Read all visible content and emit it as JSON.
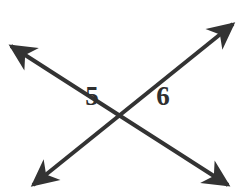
{
  "figure": {
    "type": "geometry-diagram",
    "background_color": "#ffffff",
    "stroke_color": "#333333",
    "label_color": "#2f2f2f",
    "canvas": {
      "width": 245,
      "height": 191
    },
    "intersection": {
      "x": 130,
      "y": 87
    },
    "lines": [
      {
        "name": "line-upper-left-to-lower-right",
        "from": {
          "x": 11,
          "y": 46
        },
        "to": {
          "x": 228,
          "y": 185
        },
        "stroke_width": 4,
        "arrow_start": true,
        "arrow_end": true
      },
      {
        "name": "line-lower-left-to-upper-right",
        "from": {
          "x": 33,
          "y": 185
        },
        "to": {
          "x": 233,
          "y": 24
        },
        "stroke_width": 4,
        "arrow_start": true,
        "arrow_end": true
      }
    ],
    "labels": [
      {
        "name": "angle-label-5",
        "text": "5",
        "x": 92,
        "y": 96
      },
      {
        "name": "angle-label-6",
        "text": "6",
        "x": 163,
        "y": 96
      }
    ]
  }
}
